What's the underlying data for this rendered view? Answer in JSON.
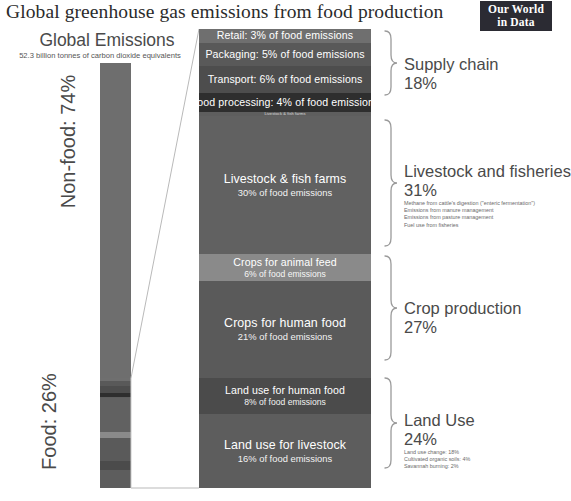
{
  "title": "Global greenhouse gas emissions from food production",
  "logo": {
    "line1": "Our World",
    "line2": "in Data"
  },
  "left": {
    "heading": "Global Emissions",
    "subheading": "52.3 billion tonnes of carbon dioxide equivalents",
    "nonfood_label": "Non-food: 74%",
    "food_label": "Food: 26%"
  },
  "segments": [
    {
      "name": "retail",
      "main": "Retail: 3% of food emissions",
      "sub": "",
      "pct": 3,
      "color": "#6f6f6f"
    },
    {
      "name": "packaging",
      "main": "Packaging: 5% of food emissions",
      "sub": "",
      "pct": 5,
      "color": "#595959"
    },
    {
      "name": "transport",
      "main": "Transport: 6% of food emissions",
      "sub": "",
      "pct": 6,
      "color": "#4d4d4d"
    },
    {
      "name": "food-processing",
      "main": "Food processing: 4% of food emissions",
      "sub": "",
      "pct": 4,
      "color": "#2e2e2e"
    },
    {
      "name": "livestock-hdr",
      "main": "Livestock & fish farms",
      "sub": "",
      "pct": 1,
      "color": "#5e5e5e"
    },
    {
      "name": "livestock",
      "main": "Livestock & fish farms",
      "sub": "30% of food emissions",
      "pct": 30,
      "color": "#616161"
    },
    {
      "name": "animal-feed",
      "main": "Crops for animal feed",
      "sub": "6% of food emissions",
      "pct": 6,
      "color": "#8a8a8a"
    },
    {
      "name": "human-crops",
      "main": "Crops for human food",
      "sub": "21% of food emissions",
      "pct": 21,
      "color": "#5a5a5a"
    },
    {
      "name": "land-human",
      "main": "Land use for human food",
      "sub": "8% of food emissions",
      "pct": 8,
      "color": "#4b4b4b"
    },
    {
      "name": "land-livestock",
      "main": "Land use for livestock",
      "sub": "16% of food emissions",
      "pct": 16,
      "color": "#5d5d5d"
    }
  ],
  "annotations": [
    {
      "name": "supply-chain",
      "title": "Supply chain",
      "pct": "18%",
      "notes": []
    },
    {
      "name": "livestock",
      "title": "Livestock and fisheries",
      "pct": "31%",
      "notes": [
        "Methane from cattle's digestion (\"enteric fermentation\")",
        "Emissions from manure management",
        "Emissions from pasture management",
        "Fuel use from fisheries"
      ]
    },
    {
      "name": "crop",
      "title": "Crop production",
      "pct": "27%",
      "notes": []
    },
    {
      "name": "land-use",
      "title": "Land Use",
      "pct": "24%",
      "notes": [
        "Land use change: 18%",
        "Cultivated organic soils: 4%",
        "Savannah burning: 2%"
      ]
    }
  ],
  "chart_data": {
    "type": "bar",
    "title": "Global greenhouse gas emissions from food production",
    "subtitle": "52.3 billion tonnes of carbon dioxide equivalents",
    "total_emissions_gt": 52.3,
    "units": "billion tonnes CO2 equivalents",
    "overview_split": {
      "categories": [
        "Non-food",
        "Food"
      ],
      "values": [
        74,
        26
      ],
      "unit": "% of global emissions"
    },
    "categories": [
      "Retail",
      "Packaging",
      "Transport",
      "Food processing",
      "Livestock & fish farms",
      "Crops for animal feed",
      "Crops for human food",
      "Land use for human food",
      "Land use for livestock"
    ],
    "values": [
      3,
      5,
      6,
      4,
      30,
      6,
      21,
      8,
      16
    ],
    "ylabel": "% of food emissions",
    "groups": [
      {
        "name": "Supply chain",
        "value": 18,
        "members": [
          "Retail",
          "Packaging",
          "Transport",
          "Food processing"
        ]
      },
      {
        "name": "Livestock and fisheries",
        "value": 31,
        "members": [
          "Livestock & fish farms"
        ]
      },
      {
        "name": "Crop production",
        "value": 27,
        "members": [
          "Crops for animal feed",
          "Crops for human food"
        ]
      },
      {
        "name": "Land Use",
        "value": 24,
        "members": [
          "Land use for human food",
          "Land use for livestock"
        ]
      }
    ],
    "land_use_breakdown": {
      "categories": [
        "Land use change",
        "Cultivated organic soils",
        "Savannah burning"
      ],
      "values": [
        18,
        4,
        2
      ]
    },
    "legend": "none",
    "grid": false
  }
}
